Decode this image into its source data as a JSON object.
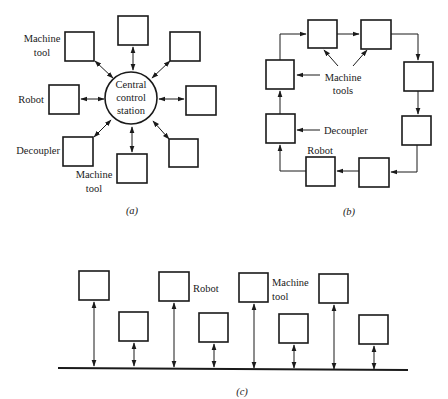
{
  "diagram_a": {
    "caption": "(a)",
    "center_label_lines": [
      "Central",
      "control",
      "station"
    ],
    "labels": {
      "machine_tool_top_lines": [
        "Machine",
        "tool"
      ],
      "robot": "Robot",
      "decoupler": "Decoupler",
      "machine_tool_bottom_lines": [
        "Machine",
        "tool"
      ]
    },
    "stations": 8
  },
  "diagram_b": {
    "caption": "(b)",
    "labels": {
      "machine_tools_lines": [
        "Machine",
        "tools"
      ],
      "decoupler": "Decoupler",
      "robot": "Robot"
    },
    "stations": 8
  },
  "diagram_c": {
    "caption": "(c)",
    "labels": {
      "robot": "Robot",
      "machine_tool_lines": [
        "Machine",
        "tool"
      ]
    },
    "stations": 8
  },
  "colors": {
    "stroke": "#1a1a1a",
    "background": "#ffffff"
  }
}
